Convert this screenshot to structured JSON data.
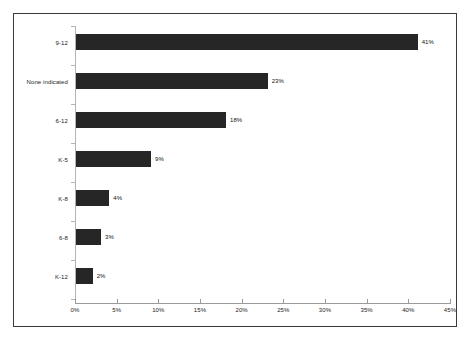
{
  "chart_data": {
    "type": "bar",
    "orientation": "horizontal",
    "title": "",
    "subtitle": "",
    "xlabel": "",
    "ylabel": "",
    "categories": [
      "9-12",
      "None indicated",
      "6-12",
      "K-5",
      "K-8",
      "6-8",
      "K-12"
    ],
    "values": [
      41,
      23,
      18,
      9,
      4,
      3,
      2
    ],
    "value_labels": [
      "41%",
      "23%",
      "18%",
      "9%",
      "4%",
      "3%",
      "2%"
    ],
    "xlim": [
      0,
      45
    ],
    "xticks": [
      0,
      5,
      10,
      15,
      20,
      25,
      30,
      35,
      40,
      45
    ],
    "xtick_labels": [
      "0%",
      "5%",
      "10%",
      "15%",
      "20%",
      "25%",
      "30%",
      "35%",
      "40%",
      "45%"
    ],
    "grid": false,
    "legend": false,
    "legend_position": "none",
    "bar_color": "#262626",
    "axis_color": "#9a9a9a",
    "category_axis_color": "#b3b3b3",
    "background_color": "#ffffff",
    "border_color": "#3a3a3a",
    "text_color": "#1a1a1a"
  }
}
